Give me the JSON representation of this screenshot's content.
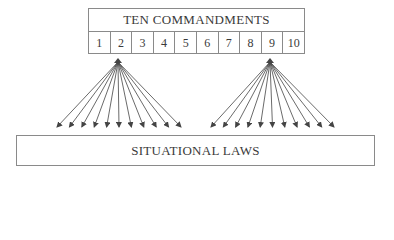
{
  "diagram": {
    "top": {
      "title": "TEN COMMANDMENTS",
      "cells": [
        "1",
        "2",
        "3",
        "4",
        "5",
        "6",
        "7",
        "8",
        "9",
        "10"
      ]
    },
    "bottom": {
      "title": "SITUATIONAL LAWS"
    },
    "fans": [
      {
        "source_cell": "2",
        "arrow_count": 11,
        "apex": [
          118,
          62
        ],
        "tip_y": 127,
        "tip_x_range": [
          57,
          181
        ]
      },
      {
        "source_cell": "9",
        "arrow_count": 11,
        "apex": [
          270,
          62
        ],
        "tip_y": 127,
        "tip_x_range": [
          211,
          334
        ]
      }
    ],
    "colors": {
      "line": "#8a8a8a",
      "arrow": "#444444",
      "text": "#3a3a3a"
    }
  }
}
